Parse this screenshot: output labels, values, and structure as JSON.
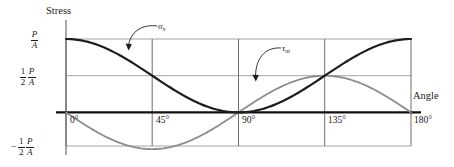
{
  "figure": {
    "name": "normal-and-shear-stress-vs-angle",
    "background": "#ffffff",
    "frame_color": "#9a9a9a",
    "zero_axis_color": "#111111"
  },
  "axes": {
    "y_title": "Stress",
    "x_title": "Angle",
    "x_ticks": [
      {
        "label": "0°",
        "value": 0
      },
      {
        "label": "45°",
        "value": 45
      },
      {
        "label": "90°",
        "value": 90
      },
      {
        "label": "135°",
        "value": 135
      },
      {
        "label": "180°",
        "value": 180
      }
    ],
    "y_ticks": [
      {
        "sign": "",
        "coef_num": "",
        "coef_den": "",
        "num": "P",
        "den": "A",
        "value": 1.0,
        "label": "P/A"
      },
      {
        "sign": "",
        "coef_num": "1",
        "coef_den": "2",
        "num": "P",
        "den": "A",
        "value": 0.5,
        "label": "1/2 P/A"
      },
      {
        "sign": "−",
        "coef_num": "1",
        "coef_den": "2",
        "num": "P",
        "den": "A",
        "value": -0.5,
        "label": "-1/2 P/A"
      }
    ],
    "xlim": [
      0,
      180
    ],
    "ylim": [
      -0.5,
      1.0
    ],
    "grid": true
  },
  "curves": [
    {
      "key": "sigma_n",
      "label_base": "σ",
      "label_sub": "n",
      "color": "#1d1d1d",
      "width": 2.1,
      "formula": "cos^2(theta) * P/A",
      "leader": {
        "from_x": 176,
        "from_y": 27,
        "to_x": 128,
        "to_y": 48
      }
    },
    {
      "key": "tau_nt",
      "label_base": "τ",
      "label_sub": "nt",
      "color": "#8c8c8c",
      "width": 1.7,
      "formula": "-sin(2*theta)/2 * P/A",
      "leader": {
        "from_x": 288,
        "from_y": 50,
        "to_x": 258,
        "to_y": 80
      }
    }
  ],
  "chart_data": {
    "type": "line",
    "title": "",
    "xlabel": "Angle",
    "ylabel": "Stress",
    "xlim": [
      0,
      180
    ],
    "ylim": [
      -0.5,
      1.0
    ],
    "grid": true,
    "legend_position": "inline-annotations",
    "x_tick_labels": [
      "0°",
      "45°",
      "90°",
      "135°",
      "180°"
    ],
    "x_tick_values": [
      0,
      45,
      90,
      135,
      180
    ],
    "y_tick_labels": [
      "P/A",
      "1/2 P/A",
      "-1/2 P/A"
    ],
    "y_tick_values": [
      1.0,
      0.5,
      -0.5
    ],
    "y_unit": "P/A",
    "x": [
      0,
      15,
      30,
      45,
      60,
      75,
      90,
      105,
      120,
      135,
      150,
      165,
      180
    ],
    "series": [
      {
        "name": "σn",
        "expression": "(P/A)cos^2(θ)",
        "color": "#1d1d1d",
        "values": [
          1.0,
          0.933,
          0.75,
          0.5,
          0.25,
          0.067,
          0.0,
          0.067,
          0.25,
          0.5,
          0.75,
          0.933,
          1.0
        ],
        "annotations": [
          {
            "x": 0,
            "y": 1.0,
            "note": "starts at P/A"
          },
          {
            "x": 90,
            "y": 0.0,
            "note": "zero at 90°"
          },
          {
            "x": 135,
            "y": 0.5,
            "note": "crosses τ at 1/2 P/A"
          },
          {
            "x": 180,
            "y": 1.0,
            "note": "returns to P/A"
          }
        ]
      },
      {
        "name": "τnt",
        "expression": "-(P/2A)sin(2θ)",
        "color": "#8c8c8c",
        "values": [
          0.0,
          -0.25,
          -0.433,
          -0.5,
          -0.433,
          -0.25,
          0.0,
          0.25,
          0.433,
          0.5,
          0.433,
          0.25,
          0.0
        ],
        "annotations": [
          {
            "x": 0,
            "y": 0.0,
            "note": "zero at 0°"
          },
          {
            "x": 45,
            "y": -0.5,
            "note": "minimum -1/2 P/A"
          },
          {
            "x": 90,
            "y": 0.0,
            "note": "zero at 90°"
          },
          {
            "x": 135,
            "y": 0.5,
            "note": "maximum 1/2 P/A"
          },
          {
            "x": 180,
            "y": 0.0,
            "note": "zero at 180°"
          }
        ]
      }
    ]
  }
}
